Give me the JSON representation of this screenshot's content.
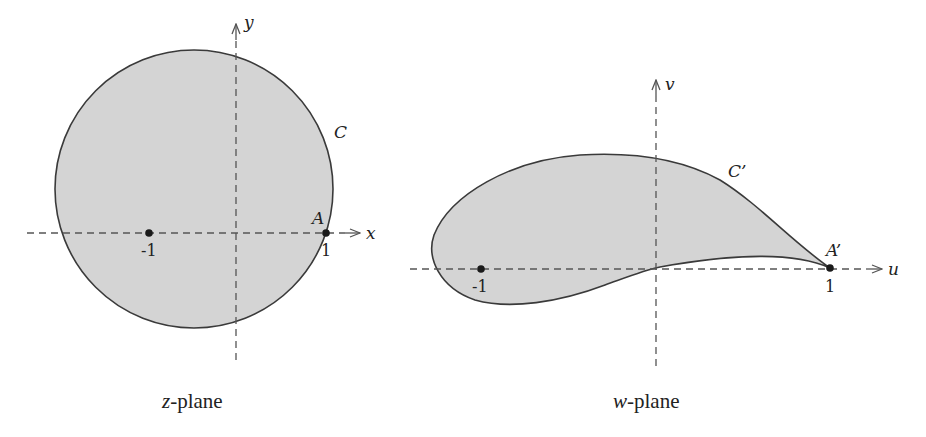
{
  "figure": {
    "colors": {
      "region_fill": "#d4d4d4",
      "region_stroke": "#3a3a3a",
      "axis": "#555555",
      "text": "#222222"
    }
  },
  "z_plane": {
    "caption_var": "z",
    "caption_rest": "-plane",
    "x_axis_label": "x",
    "y_axis_label": "y",
    "curve_label": "C",
    "point_label": "A",
    "tick_neg": "-1",
    "tick_pos": "1",
    "circle": {
      "cx": 194,
      "cy": 189,
      "r": 139
    }
  },
  "w_plane": {
    "caption_var": "w",
    "caption_rest": "-plane",
    "u_axis_label": "u",
    "v_axis_label": "v",
    "curve_label": "C’",
    "point_label": "A’",
    "tick_neg": "-1",
    "tick_pos": "1"
  }
}
